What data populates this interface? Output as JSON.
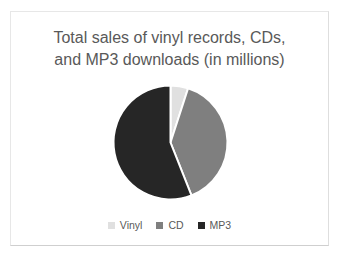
{
  "frame": {
    "background": "#ffffff",
    "border_color": "#e7e7e7",
    "border_bottom_color": "#cfcfcf"
  },
  "chart_data": {
    "type": "pie",
    "title": "Total sales of vinyl records, CDs, and MP3 downloads (in millions)",
    "title_lines": [
      "Total sales of vinyl records, CDs,",
      "and MP3 downloads (in millions)"
    ],
    "categories": [
      "Vinyl",
      "CD",
      "MP3"
    ],
    "values_percent": [
      5,
      39,
      56
    ],
    "colors": [
      "#e0e0e0",
      "#7f7f7f",
      "#262626"
    ],
    "separator_color": "#ffffff",
    "start_angle_deg": 0,
    "direction": "clockwise",
    "legend_position": "bottom",
    "title_color": "#595959",
    "legend_text_color": "#595959",
    "data_labels": "none"
  }
}
